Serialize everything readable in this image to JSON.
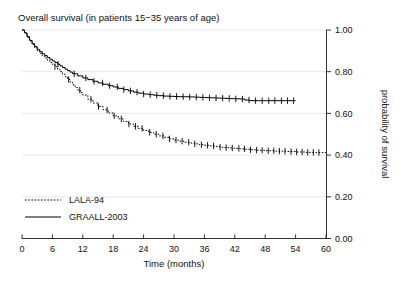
{
  "chart_data": {
    "type": "line",
    "title": "Overall survival (in patients 15−35 years of age)",
    "subtitle": "",
    "xlabel": "Time (months)",
    "ylabel": "probability of survival",
    "xlim": [
      0,
      60
    ],
    "ylim": [
      0,
      1.0
    ],
    "xticks": [
      "0",
      "6",
      "12",
      "18",
      "24",
      "30",
      "36",
      "42",
      "48",
      "54",
      "60"
    ],
    "xtick_values": [
      0,
      6,
      12,
      18,
      24,
      30,
      36,
      42,
      48,
      54,
      60
    ],
    "yticks": [
      "0.00",
      "0.20",
      "0.40",
      "0.60",
      "0.80",
      "1.00"
    ],
    "ytick_values": [
      0.0,
      0.2,
      0.4,
      0.6,
      0.8,
      1.0
    ],
    "grid": true,
    "grid_axis": "y",
    "yaxis_position": "right",
    "legend_position": "lower left",
    "curve_style": "kaplan-meier step with censoring ticks",
    "series": [
      {
        "name": "LALA-94",
        "style": "dotted",
        "color": "#000000",
        "points": [
          [
            0,
            1.0
          ],
          [
            0.5,
            0.985
          ],
          [
            1,
            0.965
          ],
          [
            1.5,
            0.947
          ],
          [
            2,
            0.93
          ],
          [
            2.5,
            0.915
          ],
          [
            3,
            0.9
          ],
          [
            3.5,
            0.888
          ],
          [
            4,
            0.876
          ],
          [
            4.5,
            0.866
          ],
          [
            5,
            0.855
          ],
          [
            5.5,
            0.845
          ],
          [
            6,
            0.835
          ],
          [
            6.5,
            0.824
          ],
          [
            7,
            0.813
          ],
          [
            7.5,
            0.8
          ],
          [
            8,
            0.788
          ],
          [
            8.5,
            0.776
          ],
          [
            9,
            0.763
          ],
          [
            9.5,
            0.75
          ],
          [
            10,
            0.737
          ],
          [
            10.5,
            0.724
          ],
          [
            11,
            0.712
          ],
          [
            11.5,
            0.7
          ],
          [
            12,
            0.688
          ],
          [
            13,
            0.668
          ],
          [
            14,
            0.65
          ],
          [
            15,
            0.633
          ],
          [
            16,
            0.617
          ],
          [
            17,
            0.602
          ],
          [
            18,
            0.588
          ],
          [
            19,
            0.574
          ],
          [
            20,
            0.561
          ],
          [
            21,
            0.549
          ],
          [
            22,
            0.538
          ],
          [
            23,
            0.528
          ],
          [
            24,
            0.518
          ],
          [
            25,
            0.509
          ],
          [
            26,
            0.5
          ],
          [
            27,
            0.492
          ],
          [
            28,
            0.485
          ],
          [
            29,
            0.478
          ],
          [
            30,
            0.472
          ],
          [
            31,
            0.467
          ],
          [
            32,
            0.462
          ],
          [
            33,
            0.458
          ],
          [
            34,
            0.454
          ],
          [
            35,
            0.45
          ],
          [
            36,
            0.447
          ],
          [
            37,
            0.444
          ],
          [
            38,
            0.441
          ],
          [
            39,
            0.438
          ],
          [
            40,
            0.436
          ],
          [
            41,
            0.434
          ],
          [
            42,
            0.432
          ],
          [
            43,
            0.43
          ],
          [
            44,
            0.428
          ],
          [
            45,
            0.426
          ],
          [
            46,
            0.424
          ],
          [
            47,
            0.423
          ],
          [
            48,
            0.421
          ],
          [
            50,
            0.419
          ],
          [
            52,
            0.417
          ],
          [
            54,
            0.415
          ],
          [
            56,
            0.413
          ],
          [
            58,
            0.412
          ],
          [
            60,
            0.41
          ]
        ],
        "censor_times": [
          6.5,
          9.2,
          11.4,
          13.6,
          15.1,
          16.8,
          18.2,
          19.6,
          21.1,
          22.4,
          23.7,
          25.2,
          26.5,
          27.8,
          29.1,
          30.4,
          31.6,
          32.9,
          34.1,
          35.4,
          36.6,
          37.8,
          39.1,
          40.3,
          41.5,
          42.8,
          43.9,
          45.1,
          46.3,
          47.4,
          48.6,
          49.7,
          50.8,
          51.9,
          53.1,
          54.2,
          55.3,
          56.4,
          57.5,
          58.6
        ]
      },
      {
        "name": "GRAALL-2003",
        "style": "solid",
        "color": "#000000",
        "points": [
          [
            0,
            1.0
          ],
          [
            0.5,
            0.986
          ],
          [
            1,
            0.968
          ],
          [
            1.5,
            0.95
          ],
          [
            2,
            0.934
          ],
          [
            2.5,
            0.92
          ],
          [
            3,
            0.907
          ],
          [
            3.5,
            0.896
          ],
          [
            4,
            0.886
          ],
          [
            4.5,
            0.877
          ],
          [
            5,
            0.868
          ],
          [
            5.5,
            0.86
          ],
          [
            6,
            0.852
          ],
          [
            6.5,
            0.844
          ],
          [
            7,
            0.836
          ],
          [
            7.5,
            0.828
          ],
          [
            8,
            0.82
          ],
          [
            8.5,
            0.812
          ],
          [
            9,
            0.805
          ],
          [
            9.5,
            0.798
          ],
          [
            10,
            0.79
          ],
          [
            11,
            0.78
          ],
          [
            12,
            0.77
          ],
          [
            13,
            0.762
          ],
          [
            14,
            0.754
          ],
          [
            15,
            0.746
          ],
          [
            16,
            0.74
          ],
          [
            17,
            0.733
          ],
          [
            18,
            0.727
          ],
          [
            19,
            0.72
          ],
          [
            20,
            0.714
          ],
          [
            21,
            0.708
          ],
          [
            22,
            0.702
          ],
          [
            23,
            0.697
          ],
          [
            24,
            0.693
          ],
          [
            25,
            0.69
          ],
          [
            26,
            0.687
          ],
          [
            27,
            0.685
          ],
          [
            28,
            0.683
          ],
          [
            29,
            0.682
          ],
          [
            30,
            0.681
          ],
          [
            31,
            0.68
          ],
          [
            32,
            0.68
          ],
          [
            33,
            0.679
          ],
          [
            34,
            0.678
          ],
          [
            35,
            0.677
          ],
          [
            36,
            0.676
          ],
          [
            37,
            0.675
          ],
          [
            38,
            0.674
          ],
          [
            39,
            0.673
          ],
          [
            40,
            0.672
          ],
          [
            41,
            0.671
          ],
          [
            42,
            0.67
          ],
          [
            43,
            0.669
          ],
          [
            44,
            0.664
          ],
          [
            45,
            0.661
          ],
          [
            46,
            0.661
          ],
          [
            47,
            0.661
          ],
          [
            48,
            0.661
          ],
          [
            50,
            0.661
          ],
          [
            52,
            0.661
          ],
          [
            54,
            0.661
          ]
        ],
        "censor_times": [
          7.1,
          10.3,
          12.6,
          14.2,
          15.9,
          17.3,
          18.8,
          20.1,
          21.4,
          22.7,
          24.0,
          25.3,
          26.6,
          27.9,
          29.2,
          30.5,
          31.8,
          33.1,
          34.4,
          35.7,
          37.0,
          38.3,
          39.6,
          40.9,
          42.2,
          43.5,
          44.8,
          46.1,
          47.4,
          48.7,
          49.9,
          51.2,
          52.4,
          53.6
        ]
      }
    ]
  },
  "legend": {
    "items": [
      {
        "label": "LALA-94",
        "style": "dotted"
      },
      {
        "label": "GRAALL-2003",
        "style": "solid"
      }
    ]
  }
}
